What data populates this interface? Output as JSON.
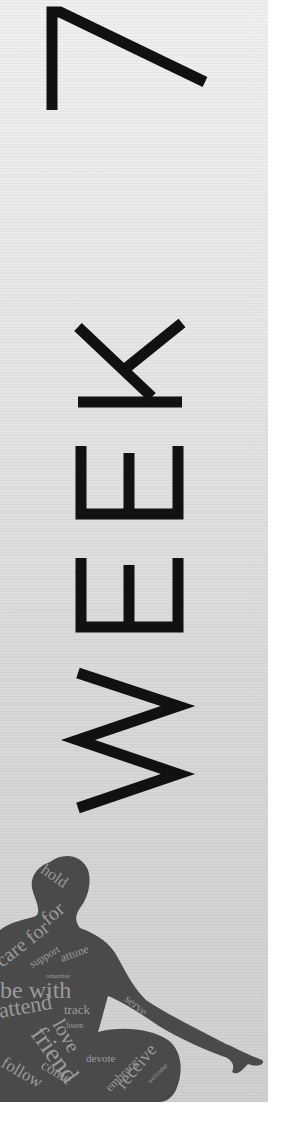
{
  "page": {
    "background_color": "#ffffff",
    "panel_color_top": "#efefef",
    "panel_color_bottom": "#cfcfcf",
    "ink_color": "#111111"
  },
  "title": {
    "word": "WEEK",
    "number": "7",
    "orientation": "rotated-90-ccw",
    "full_label": "WEEK 7"
  },
  "figure": {
    "silhouette_color": "#4a4a4a",
    "word_color": "#9a9a9a",
    "words": [
      "hold",
      "for",
      "care for",
      "support",
      "attune",
      "remember",
      "be with",
      "serve",
      "track",
      "love",
      "listen",
      "attend",
      "friend",
      "devote",
      "embrace",
      "receive",
      "welcome",
      "follow",
      "come"
    ]
  }
}
